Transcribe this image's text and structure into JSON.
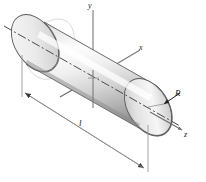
{
  "figure": {
    "type": "technical-line-drawing",
    "canvas": {
      "width": 206,
      "height": 182,
      "background": "#ffffff"
    },
    "axes": [
      {
        "name": "y",
        "label": "y",
        "direction": "vertical-up",
        "style": "solid",
        "color": "#6e6e6e"
      },
      {
        "name": "x",
        "label": "x",
        "direction": "upper-right",
        "style": "solid",
        "color": "#6e6e6e"
      },
      {
        "name": "z",
        "label": "z",
        "direction": "lower-right",
        "style": "solid",
        "color": "#6e6e6e"
      }
    ],
    "annotations": [
      {
        "name": "radius",
        "label": "R",
        "kind": "leader-arrow",
        "target": "right-end-cap-edge"
      },
      {
        "name": "length",
        "label": "l",
        "kind": "dimension-line",
        "target": "cylinder-length",
        "arrowheads": "both-ends"
      }
    ],
    "solid": {
      "name": "cylinder",
      "orientation": "diagonal-upper-left-to-lower-right",
      "centerline_style": "dash-dot",
      "shading": {
        "body_light": "#ffffff",
        "body_mid": "#dcdcdc",
        "body_dark": "#9a9a9a",
        "edge": "#555555",
        "cap_light": "#f2f2f2",
        "cap_dark": "#b4b4b4"
      }
    },
    "colors": {
      "outline": "#444444",
      "axis": "#6e6e6e",
      "dimension": "#8a8a8a",
      "text": "#1a1a1a"
    },
    "labels": {
      "y_axis": "y",
      "x_axis": "x",
      "z_axis": "z",
      "radius": "R",
      "length": "l"
    }
  }
}
